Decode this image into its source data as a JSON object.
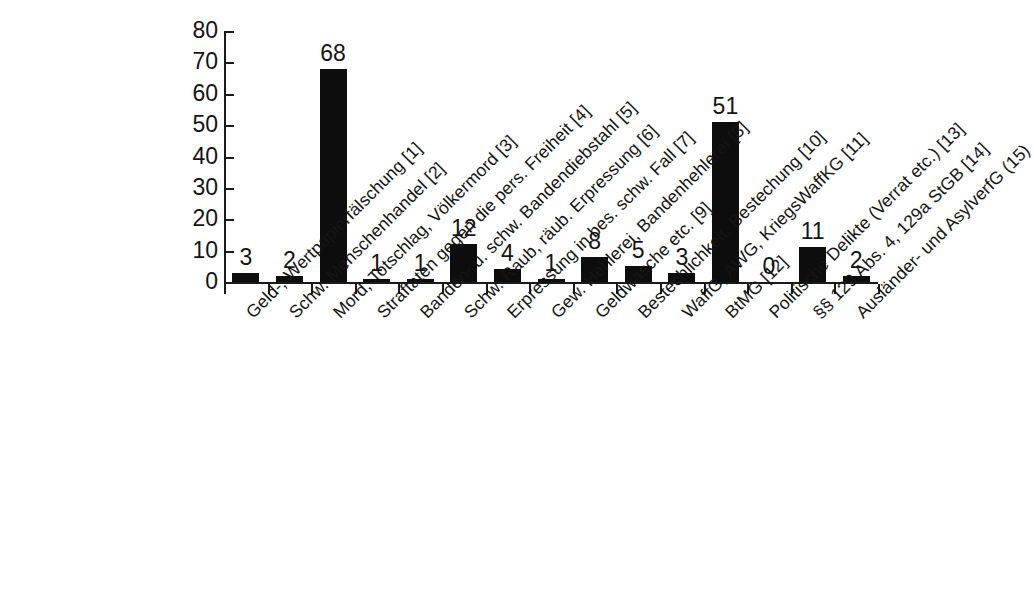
{
  "chart_data": {
    "type": "bar",
    "title": "",
    "subtitle": "",
    "xlabel": "",
    "ylabel": "",
    "ylim": [
      0,
      80
    ],
    "ytick_labels": [
      "80",
      "70",
      "60",
      "50",
      "40",
      "30",
      "20",
      "10",
      "0"
    ],
    "yticks": [
      80,
      70,
      60,
      50,
      40,
      30,
      20,
      10,
      0
    ],
    "grid": false,
    "legend": false,
    "legend_position": "none",
    "bar_color": "#0d0d0d",
    "axis_color": "#1a1a1a",
    "text_color": "#141414",
    "background_color": "#ffffff",
    "data_labels_shown": true,
    "categories": [
      "Geld-, Wertpapierfälschung [1]",
      "Schw. Menschenhandel [2]",
      "Mord, Totschlag, Völkermord [3]",
      "Straftaten gegen die pers. Freiheit [4]",
      "Banden- u. schw. Bandendiebstahl [5]",
      "Schw. Raub, räub. Erpressung [6]",
      "Erpressung in bes. schw. Fall [7]",
      "Gew. Hehlerei, Bandenhehlerei [8]",
      "Geldwäsche etc. [9]",
      "Bestechlichkeit, Bestechung [10]",
      "WaffG, AWG, KriegsWaffKG [11]",
      "BtMG [12]",
      "Politische Delikte (Verrat etc.) [13]",
      "§§ 129 Abs. 4, 129a StGB [14]",
      "Ausländer- und AsylverfG (15)"
    ],
    "values": [
      3,
      2,
      68,
      1,
      1,
      12,
      4,
      1,
      8,
      5,
      3,
      51,
      0,
      11,
      2
    ],
    "value_labels": [
      "3",
      "2",
      "68",
      "1",
      "1",
      "12",
      "4",
      "1",
      "8",
      "5",
      "3",
      "51",
      "0",
      "11",
      "2"
    ]
  }
}
